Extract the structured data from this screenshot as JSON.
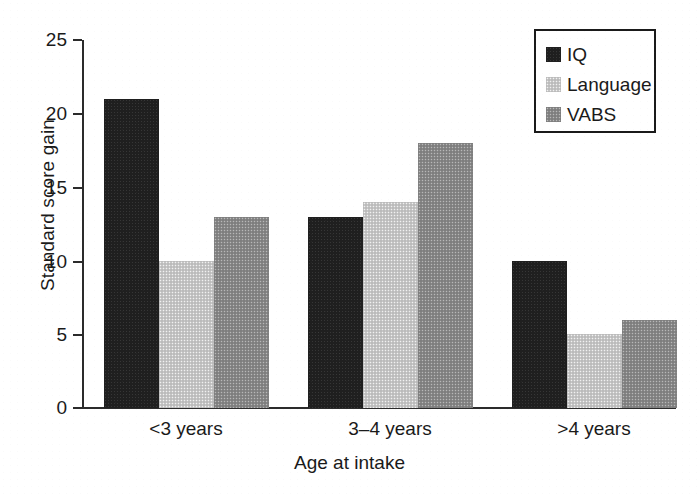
{
  "chart_data": {
    "type": "bar",
    "title": "",
    "xlabel": "Age at intake",
    "ylabel": "Standard score gain",
    "categories": [
      "<3 years",
      "3–4 years",
      ">4 years"
    ],
    "series": [
      {
        "name": "IQ",
        "values": [
          21,
          13,
          10
        ],
        "color": "#1f1f1f"
      },
      {
        "name": "Language",
        "values": [
          10,
          14,
          5
        ],
        "color": "#c7c7c7"
      },
      {
        "name": "VABS",
        "values": [
          13,
          18,
          6
        ],
        "color": "#888888"
      }
    ],
    "ylim": [
      0,
      25
    ],
    "yticks": [
      0,
      5,
      10,
      15,
      20,
      25
    ],
    "ytick_labels": [
      "0",
      "5",
      "10",
      "15",
      "20",
      "25"
    ],
    "grid": false,
    "legend_position": "top-right",
    "legend_entries": [
      "IQ",
      "Language",
      "VABS"
    ]
  },
  "axis": {
    "y_title": "Standard score gain",
    "x_title": "Age at intake",
    "y_labels": [
      "25",
      "20",
      "15",
      "10",
      "5",
      "0"
    ],
    "x_labels": [
      "<3 years",
      "3–4 years",
      ">4 years"
    ]
  },
  "legend": {
    "items": [
      {
        "label": "IQ"
      },
      {
        "label": "Language"
      },
      {
        "label": "VABS"
      }
    ]
  }
}
